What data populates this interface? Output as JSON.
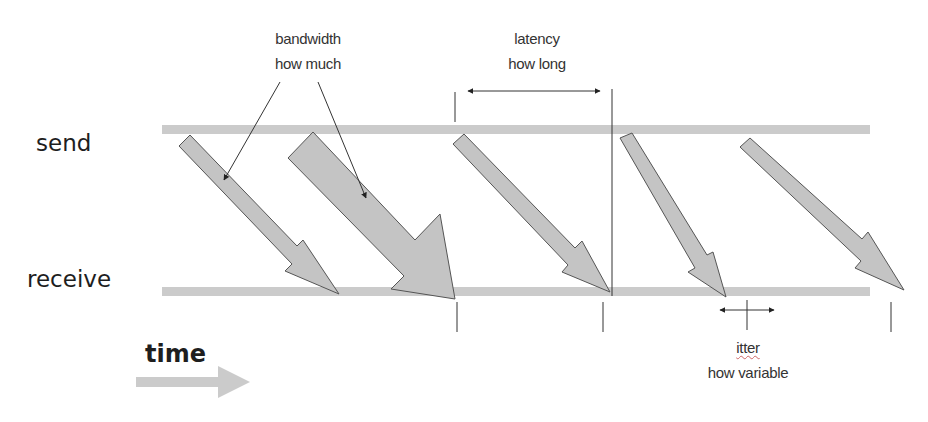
{
  "labels": {
    "send": "send",
    "receive": "receive",
    "time": "time"
  },
  "annotations": {
    "bandwidth": {
      "title": "bandwidth",
      "subtitle": "how much"
    },
    "latency": {
      "title": "latency",
      "subtitle": "how long"
    },
    "jitter": {
      "title": "itter",
      "subtitle": "how variable"
    }
  },
  "colors": {
    "line": "#cbcbcb",
    "packet_fill": "#c4c4c4",
    "packet_stroke": "#555555",
    "annotation": "#222222"
  },
  "packets": [
    {
      "id": 1,
      "description": "narrow packet arrow"
    },
    {
      "id": 2,
      "description": "wide packet arrow (high bandwidth)"
    },
    {
      "id": 3,
      "description": "packet arrow showing latency"
    },
    {
      "id": 4,
      "description": "steeper packet arrow (jitter)"
    },
    {
      "id": 5,
      "description": "late packet arrow"
    }
  ]
}
